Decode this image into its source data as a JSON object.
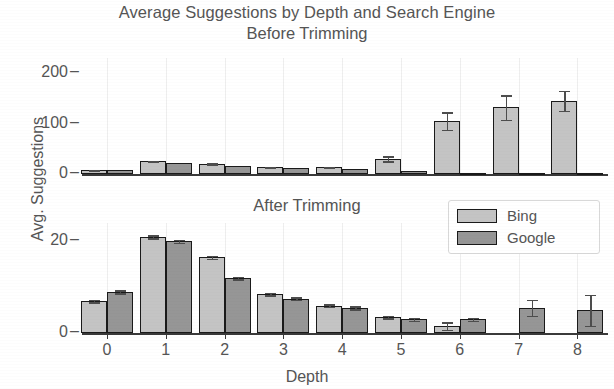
{
  "chart_data": {
    "type": "bar",
    "title": "Average Suggestions by Depth and Search Engine",
    "xlabel": "Depth",
    "ylabel": "Avg. Suggestions",
    "grid": true,
    "legend_position": "middle-right",
    "legend": [
      "Bing",
      "Google"
    ],
    "colors": {
      "bing": "#c4c4c4",
      "google": "#969696",
      "edge": "#1a1a1a",
      "text": "#555555"
    },
    "categories": [
      "0",
      "1",
      "2",
      "3",
      "4",
      "5",
      "6",
      "7",
      "8"
    ],
    "panels": [
      {
        "subtitle": "Before Trimming",
        "ylim": [
          0,
          230
        ],
        "yticks": [
          "0",
          "100",
          "200"
        ],
        "ytick_values": [
          0,
          100,
          200
        ],
        "series": [
          {
            "name": "Bing",
            "values": [
              7,
              25,
              20,
              13,
              13,
              30,
              105,
              132,
              145
            ],
            "errors": [
              1,
              1,
              1,
              1,
              1,
              5,
              17,
              24,
              20
            ]
          },
          {
            "name": "Google",
            "values": [
              7,
              22,
              15,
              11,
              9,
              6,
              2,
              2,
              2
            ],
            "errors": [
              0,
              0,
              0,
              0,
              0,
              0,
              0,
              0,
              0
            ]
          }
        ]
      },
      {
        "subtitle": "After Trimming",
        "ylim": [
          0,
          24
        ],
        "yticks": [
          "0",
          "20"
        ],
        "ytick_values": [
          0,
          20
        ],
        "series": [
          {
            "name": "Bing",
            "values": [
              7,
              21,
              16.5,
              8.5,
              6,
              3.5,
              1.5,
              0,
              0
            ],
            "errors": [
              0.3,
              0.3,
              0.3,
              0.3,
              0.3,
              0.3,
              0.8,
              0,
              0
            ]
          },
          {
            "name": "Google",
            "values": [
              9,
              20,
              12,
              7.5,
              5.5,
              3,
              3,
              5.5,
              5
            ],
            "errors": [
              0.3,
              0.3,
              0.3,
              0.3,
              0.3,
              0.3,
              0.3,
              1.7,
              3.4
            ]
          }
        ]
      }
    ]
  }
}
